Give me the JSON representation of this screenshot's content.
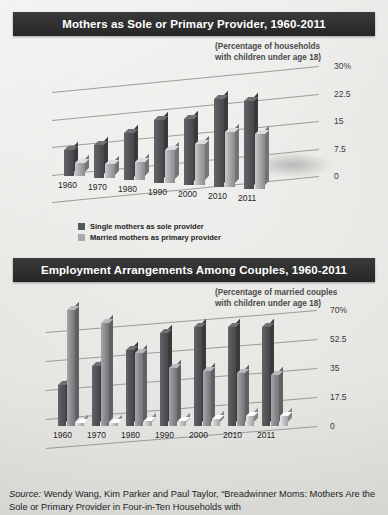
{
  "page": {
    "background": "#e8e8e6"
  },
  "panels": [
    {
      "id": "mothers-provider",
      "title": "Mothers as Sole or Primary Provider, 1960-2011",
      "subtitle_line1": "(Percentage of households",
      "subtitle_line2": "with children under age 18)",
      "legend": [
        {
          "label": "Single mothers as sole provider",
          "color": "#55565a"
        },
        {
          "label": "Married mothers as primary provider",
          "color": "#a9aaac"
        }
      ]
    },
    {
      "id": "employment-arrangements",
      "title": "Employment Arrangements Among Couples, 1960-2011",
      "subtitle_line1": "(Percentage of married couples",
      "subtitle_line2": "with children under age 18)",
      "legend": [
        {
          "label": "Dual Income",
          "color": "#55565a"
        },
        {
          "label": "Only father employed",
          "color": "#8d8e91"
        },
        {
          "label": "Only mother employed",
          "color": "#c2c3c4"
        }
      ]
    }
  ],
  "source": {
    "prefix": "Source:",
    "text": " Wendy Wang, Kim Parker and Paul Taylor, “Breadwinner Moms: Mothers Are the Sole or Primary Provider in Four-in-Ten Households with"
  },
  "chart_data": [
    {
      "type": "bar",
      "id": "mothers-provider",
      "title": "Mothers as Sole or Primary Provider, 1960-2011",
      "subtitle": "(Percentage of households with children under age 18)",
      "xlabel": "",
      "ylabel": "",
      "ylim": [
        0,
        30
      ],
      "yticks": [
        0,
        7.5,
        15,
        22.5,
        30
      ],
      "ytick_labels": [
        "0",
        "7.5",
        "15",
        "22.5",
        "30%"
      ],
      "grid": true,
      "legend_position": "below",
      "categories": [
        "1960",
        "1970",
        "1980",
        "1990",
        "2000",
        "2010",
        "2011"
      ],
      "series": [
        {
          "name": "Single mothers as sole provider",
          "color": "#55565a",
          "values": [
            7,
            9,
            13,
            17,
            18,
            24,
            24
          ]
        },
        {
          "name": "Married mothers as primary provider",
          "color": "#a9aaac",
          "values": [
            3.5,
            4,
            5,
            9,
            11,
            15,
            15
          ]
        }
      ]
    },
    {
      "type": "bar",
      "id": "employment-arrangements",
      "title": "Employment Arrangements Among Couples, 1960-2011",
      "subtitle": "(Percentage of married couples with children under age 18)",
      "xlabel": "",
      "ylabel": "",
      "ylim": [
        0,
        70
      ],
      "yticks": [
        0,
        17.5,
        35,
        52.5,
        70
      ],
      "ytick_labels": [
        "0",
        "17.5",
        "35",
        "52.5",
        "70%"
      ],
      "grid": true,
      "legend_position": "below",
      "categories": [
        "1960",
        "1970",
        "1980",
        "1990",
        "2000",
        "2010",
        "2011"
      ],
      "series": [
        {
          "name": "Dual Income",
          "color": "#55565a",
          "values": [
            25,
            36,
            46,
            56,
            60,
            60,
            60
          ]
        },
        {
          "name": "Only father employed",
          "color": "#8d8e91",
          "values": [
            70,
            62,
            44,
            35,
            33,
            32,
            31
          ]
        },
        {
          "name": "Only mother employed",
          "color": "#c2c3c4",
          "values": [
            2,
            2,
            3,
            3,
            4,
            6,
            6
          ]
        }
      ]
    }
  ]
}
